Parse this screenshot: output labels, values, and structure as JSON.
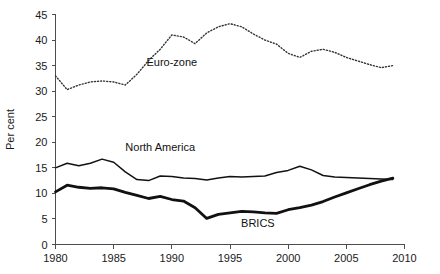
{
  "chart_data": {
    "type": "line",
    "title": "",
    "xlabel": "",
    "ylabel": "Per cent",
    "xlim": [
      1980,
      2010
    ],
    "ylim": [
      0,
      45
    ],
    "ytick_step": 5,
    "xtick_step": 5,
    "grid": false,
    "legend": "inline-annotations",
    "xticks": [
      1980,
      1985,
      1990,
      1995,
      2000,
      2005,
      2010
    ],
    "yticks": [
      0,
      5,
      10,
      15,
      20,
      25,
      30,
      35,
      40,
      45
    ],
    "x": [
      1980,
      1981,
      1982,
      1983,
      1984,
      1985,
      1986,
      1987,
      1988,
      1989,
      1990,
      1991,
      1992,
      1993,
      1994,
      1995,
      1996,
      1997,
      1998,
      1999,
      2000,
      2001,
      2002,
      2003,
      2004,
      2005,
      2006,
      2007,
      2008,
      2009
    ],
    "series": [
      {
        "name": "Euro-zone",
        "style": "dotted",
        "color": "#333333",
        "width": 1.4,
        "label_x": 1990.0,
        "label_y": 35.0,
        "values": [
          33.0,
          30.3,
          31.2,
          31.8,
          32.0,
          31.8,
          31.2,
          33.3,
          36.0,
          38.2,
          41.0,
          40.6,
          39.3,
          41.4,
          42.6,
          43.2,
          42.6,
          41.2,
          40.0,
          39.2,
          37.4,
          36.6,
          37.8,
          38.2,
          37.6,
          36.6,
          35.9,
          35.2,
          34.6,
          35.0
        ]
      },
      {
        "name": "North America",
        "style": "solid-thin",
        "color": "#111111",
        "width": 1.5,
        "label_x": 1989.0,
        "label_y": 18.3,
        "values": [
          15.0,
          15.9,
          15.4,
          15.9,
          16.7,
          16.1,
          14.2,
          12.7,
          12.5,
          13.4,
          13.3,
          13.0,
          12.9,
          12.6,
          13.0,
          13.3,
          13.2,
          13.3,
          13.4,
          14.1,
          14.5,
          15.3,
          14.6,
          13.5,
          13.2,
          13.1,
          13.0,
          12.9,
          12.8,
          12.7
        ]
      },
      {
        "name": "BRICS",
        "style": "solid-thick",
        "color": "#111111",
        "width": 2.8,
        "label_x": 1997.4,
        "label_y": 3.4,
        "values": [
          10.3,
          11.6,
          11.2,
          11.0,
          11.1,
          10.9,
          10.2,
          9.6,
          9.0,
          9.4,
          8.8,
          8.5,
          7.2,
          5.1,
          5.9,
          6.2,
          6.5,
          6.4,
          6.2,
          6.1,
          6.8,
          7.2,
          7.7,
          8.4,
          9.3,
          10.1,
          10.9,
          11.7,
          12.4,
          13.0
        ]
      }
    ]
  }
}
